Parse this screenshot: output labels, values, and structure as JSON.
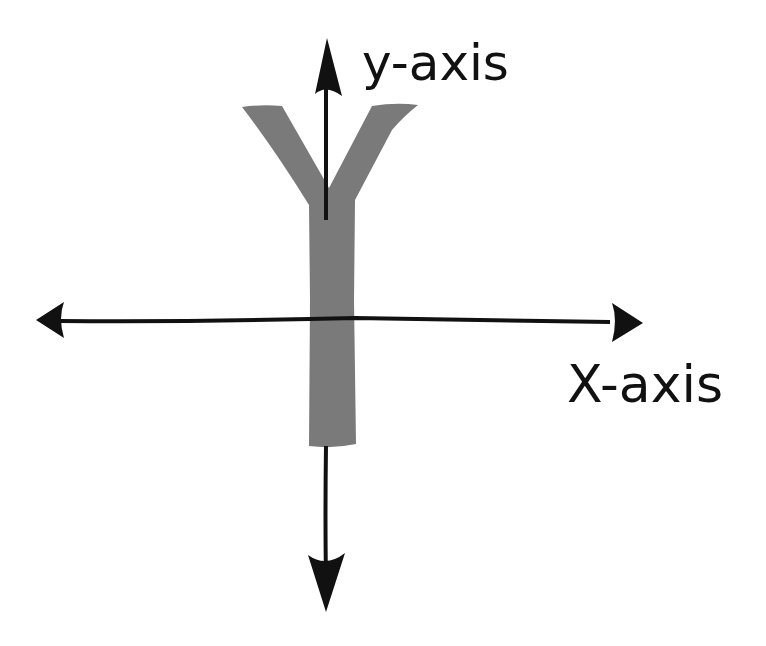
{
  "diagram": {
    "type": "coordinate-axes",
    "letter": "Y",
    "labels": {
      "y_axis": "y-axis",
      "x_axis": "X-axis"
    },
    "colors": {
      "background": "#ffffff",
      "letter_fill": "#7a7a7a",
      "axis_stroke": "#111111"
    }
  }
}
